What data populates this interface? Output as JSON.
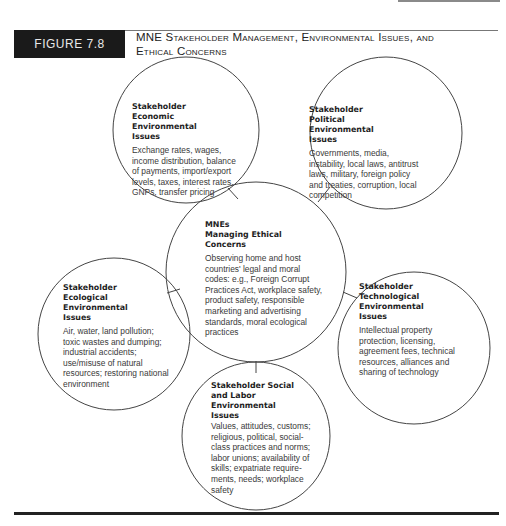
{
  "figure": {
    "label": "FIGURE 7.8",
    "title_line1": "MNE Stakeholder Management, Environmental Issues, and",
    "title_line2": "Ethical Concerns"
  },
  "nodes": {
    "center": {
      "heading_line1": "MNEs",
      "heading_line2": "Managing Ethical Concerns",
      "body": "Observing home and host countries' legal and moral codes: e.g., Foreign Corrupt Practices Act, workplace safety, product safety, responsible marketing and advertising standards, moral ecological practices"
    },
    "economic": {
      "heading": "Stakeholder Economic Environmental Issues",
      "body": "Exchange rates, wages, income distribution, balance of payments, import/export levels, taxes, interest rates, GNPs, transfer pricing"
    },
    "political": {
      "heading": "Stakeholder Political Environmental Issues",
      "body": "Governments, media, instability, local laws, antitrust laws, military, foreign policy and treaties, corruption, local competition"
    },
    "ecological": {
      "heading": "Stakeholder Ecological Environmental Issues",
      "body": "Air, water, land pollution; toxic wastes and dumping; industrial accidents; use/misuse of natural resources; restoring national environment"
    },
    "technological": {
      "heading": "Stakeholder Technological Environmental Issues",
      "body": "Intellectual property protection, licensing, agreement fees, technical resources, alliances and sharing of technology"
    },
    "social": {
      "heading": "Stakeholder Social and Labor Environmental Issues",
      "body": "Values, attitudes, customs; religious, political, social-class practices and norms; labor unions; availability of skills; expatriate require-ments, needs; workplace safety"
    }
  },
  "colors": {
    "label_bg": "#1a1a1a",
    "label_text": "#e8e8e8",
    "circle_stroke": "#444444",
    "heading_text": "#1e1e1e",
    "body_text": "#3a3a3a"
  }
}
